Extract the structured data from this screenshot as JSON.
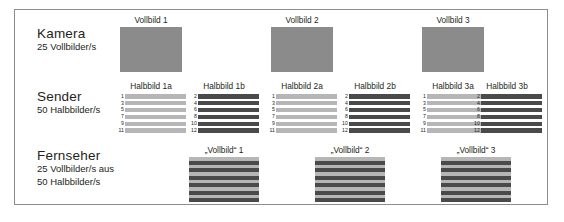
{
  "diagram": {
    "title_visible": false,
    "border_color": "#8d8d8d",
    "colors": {
      "full_frame": "#8b8b8b",
      "odd_field": "#b6b6b6",
      "even_field": "#4a4a4a",
      "text": "#231f20"
    }
  },
  "rows": [
    {
      "id": "kamera",
      "title": "Kamera",
      "sub1": "25 Vollbilder/s",
      "sub2": "",
      "sub3": ""
    },
    {
      "id": "sender",
      "title": "Sender",
      "sub1": "50 Halbbilder/s",
      "sub2": "",
      "sub3": ""
    },
    {
      "id": "fernseher",
      "title": "Fernseher",
      "sub1": "25 Vollbilder/s aus",
      "sub2": "50 Halbbilder/s",
      "sub3": ""
    }
  ],
  "kamera_frames": [
    {
      "caption": "Vollbild 1"
    },
    {
      "caption": "Vollbild 2"
    },
    {
      "caption": "Vollbild 3"
    }
  ],
  "sender_fields": [
    {
      "caption": "Halbbild 1a",
      "parity": "odd",
      "lines": [
        "1",
        "3",
        "5",
        "7",
        "9",
        "11"
      ]
    },
    {
      "caption": "Halbbild 1b",
      "parity": "even",
      "lines": [
        "2",
        "4",
        "6",
        "8",
        "10",
        "12"
      ]
    },
    {
      "caption": "Halbbild 2a",
      "parity": "odd",
      "lines": [
        "1",
        "3",
        "5",
        "7",
        "9",
        "11"
      ]
    },
    {
      "caption": "Halbbild 2b",
      "parity": "even",
      "lines": [
        "2",
        "4",
        "6",
        "8",
        "10",
        "12"
      ]
    },
    {
      "caption": "Halbbild 3a",
      "parity": "odd",
      "lines": [
        "1",
        "3",
        "5",
        "7",
        "9",
        "11"
      ]
    },
    {
      "caption": "Halbbild 3b",
      "parity": "even",
      "lines": [
        "2",
        "4",
        "6",
        "8",
        "10",
        "12"
      ]
    }
  ],
  "fernseher_frames": [
    {
      "caption": "„Vollbild“ 1"
    },
    {
      "caption": "„Vollbild“ 2"
    },
    {
      "caption": "„Vollbild“ 3"
    }
  ]
}
